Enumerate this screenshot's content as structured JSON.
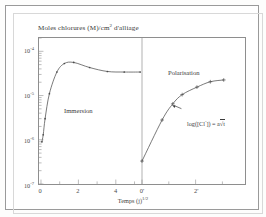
{
  "figure": {
    "title": "Moles chlorures (M)/cm",
    "title_sup": "2",
    "title_tail": " d'alliage"
  },
  "axes": {
    "xlabel_main": "Temps (j)",
    "xlabel_sup": "1/2",
    "ytick_labels": [
      {
        "mantissa": "10",
        "exp": "-4"
      },
      {
        "mantissa": "10",
        "exp": "-5"
      },
      {
        "mantissa": "10",
        "exp": "-6"
      },
      {
        "mantissa": "10",
        "exp": "-7"
      }
    ],
    "xtick_labels": [
      "0",
      "2",
      "4",
      "0'",
      "2'"
    ]
  },
  "annotations": {
    "immersion": "Immersion",
    "polarisation": "Polarisation",
    "formula_head": "log([Cl",
    "formula_sup": "-",
    "formula_tail": "]) = a",
    "formula_radical": "√t"
  },
  "colors": {
    "curve": "#4a4a4a",
    "axis": "#8e8e8e",
    "text": "#3b3b3c",
    "divider": "#8e8e8e"
  },
  "chart_data": {
    "type": "line",
    "title": "Moles chlorures (M)/cm2 d'alliage",
    "xlabel": "Temps (j)^1/2",
    "ylabel": "Moles chlorures (M)/cm2 d'alliage",
    "yscale": "log",
    "ylim": [
      1e-07,
      0.0002
    ],
    "ytick_values": [
      0.0001,
      1e-05,
      1e-06,
      1e-07
    ],
    "grid": false,
    "legend": "none",
    "panels": [
      {
        "name": "Immersion",
        "xlim": [
          0,
          5.4
        ],
        "xtick_values": [
          0,
          2,
          4
        ],
        "series": [
          {
            "name": "Immersion chloride uptake",
            "marker": "dot",
            "x": [
              0.05,
              0.12,
              0.22,
              0.45,
              0.85,
              1.25,
              1.75,
              2.6,
              3.55,
              4.45,
              5.3
            ],
            "y": [
              9e-07,
              1.3e-06,
              3e-06,
              1.1e-05,
              3.4e-05,
              5.3e-05,
              5.6e-05,
              4.3e-05,
              3.5e-05,
              3.4e-05,
              3.4e-05
            ]
          }
        ]
      },
      {
        "name": "Polarisation",
        "xlim": [
          0,
          3.4
        ],
        "xtick_values": [
          0,
          2
        ],
        "series": [
          {
            "name": "Polarisation chloride uptake",
            "marker": "plus",
            "x": [
              0.0,
              0.75,
              1.15,
              1.5,
              2.05,
              2.55,
              3.05
            ],
            "y": [
              3.3e-07,
              2.8e-06,
              6.5e-06,
              1.05e-05,
              1.55e-05,
              2.05e-05,
              2.25e-05
            ]
          }
        ]
      }
    ]
  }
}
